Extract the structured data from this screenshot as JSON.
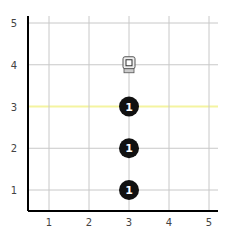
{
  "board": {
    "x_ticks": [
      "1",
      "2",
      "3",
      "4",
      "5"
    ],
    "y_ticks": [
      "1",
      "2",
      "3",
      "4",
      "5"
    ],
    "highlight_row": 3,
    "highlight_color": "#f4f4a0"
  },
  "pieces": [
    {
      "type": "token",
      "x": 3,
      "y": 3,
      "label": "1"
    },
    {
      "type": "token",
      "x": 3,
      "y": 2,
      "label": "1"
    },
    {
      "type": "token",
      "x": 3,
      "y": 1,
      "label": "1"
    }
  ],
  "robot": {
    "x": 3,
    "y": 4,
    "icon": "robot-icon"
  }
}
